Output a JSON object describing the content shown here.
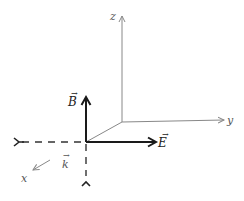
{
  "diagram": {
    "axes": {
      "x": {
        "label": "x"
      },
      "y": {
        "label": "y"
      },
      "z": {
        "label": "z"
      }
    },
    "vectors": {
      "B": {
        "label": "B",
        "arrow": "→",
        "direction": "up"
      },
      "E": {
        "label": "E",
        "arrow": "→",
        "direction": "right"
      },
      "k": {
        "label": "k",
        "arrow": "→",
        "direction": "toward x"
      }
    },
    "colors": {
      "axis": "#888888",
      "field_vector": "#1a1a1a",
      "dashed": "#333333",
      "background": "#ffffff"
    }
  }
}
